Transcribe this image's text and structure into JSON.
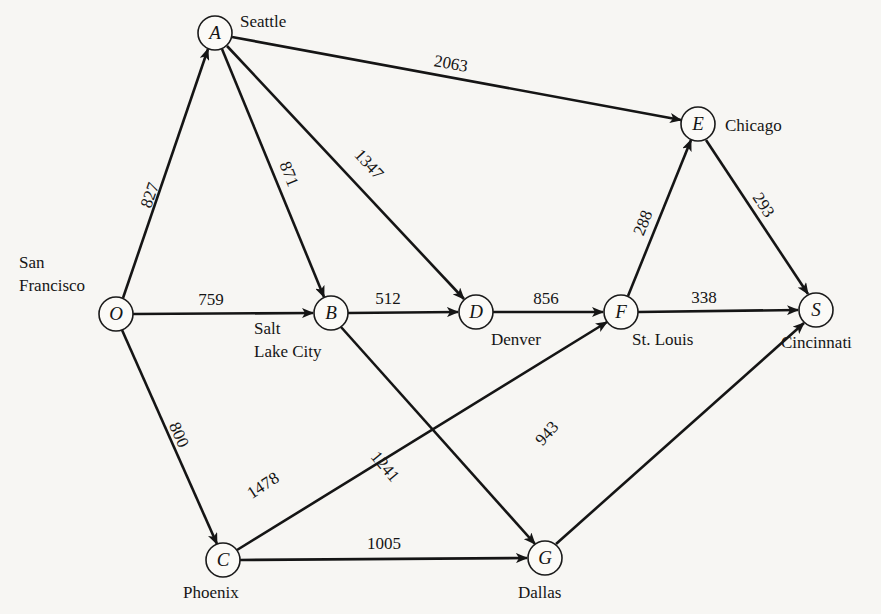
{
  "diagram": {
    "type": "directed-weighted-network",
    "nodes": [
      {
        "id": "O",
        "city": [
          "San",
          "Francisco"
        ],
        "x": 116,
        "y": 314
      },
      {
        "id": "A",
        "city": [
          "Seattle"
        ],
        "x": 215,
        "y": 33
      },
      {
        "id": "B",
        "city": [
          "Salt",
          "Lake City"
        ],
        "x": 331,
        "y": 313
      },
      {
        "id": "C",
        "city": [
          "Phoenix"
        ],
        "x": 223,
        "y": 560
      },
      {
        "id": "D",
        "city": [
          "Denver"
        ],
        "x": 476,
        "y": 312
      },
      {
        "id": "E",
        "city": [
          "Chicago"
        ],
        "x": 698,
        "y": 124
      },
      {
        "id": "F",
        "city": [
          "St. Louis"
        ],
        "x": 621,
        "y": 312
      },
      {
        "id": "G",
        "city": [
          "Dallas"
        ],
        "x": 545,
        "y": 558
      },
      {
        "id": "S",
        "city": [
          "Cincinnati"
        ],
        "x": 816,
        "y": 310
      }
    ],
    "edges": [
      {
        "from": "O",
        "to": "A",
        "weight": "827"
      },
      {
        "from": "O",
        "to": "B",
        "weight": "759"
      },
      {
        "from": "O",
        "to": "C",
        "weight": "800"
      },
      {
        "from": "A",
        "to": "B",
        "weight": "871"
      },
      {
        "from": "A",
        "to": "D",
        "weight": "1347"
      },
      {
        "from": "A",
        "to": "E",
        "weight": "2063"
      },
      {
        "from": "B",
        "to": "D",
        "weight": "512"
      },
      {
        "from": "B",
        "to": "G",
        "weight": "1241"
      },
      {
        "from": "C",
        "to": "F",
        "weight": "1478"
      },
      {
        "from": "C",
        "to": "G",
        "weight": "1005"
      },
      {
        "from": "D",
        "to": "F",
        "weight": "856"
      },
      {
        "from": "F",
        "to": "E",
        "weight": "288"
      },
      {
        "from": "F",
        "to": "S",
        "weight": "338"
      },
      {
        "from": "E",
        "to": "S",
        "weight": "293"
      },
      {
        "from": "G",
        "to": "S",
        "weight": "943"
      }
    ]
  },
  "labels": {
    "O": "O",
    "A": "A",
    "B": "B",
    "C": "C",
    "D": "D",
    "E": "E",
    "F": "F",
    "G": "G",
    "S": "S",
    "city_O_1": "San",
    "city_O_2": "Francisco",
    "city_A": "Seattle",
    "city_B_1": "Salt",
    "city_B_2": "Lake City",
    "city_C": "Phoenix",
    "city_D": "Denver",
    "city_E": "Chicago",
    "city_F": "St. Louis",
    "city_G": "Dallas",
    "city_S": "Cincinnati",
    "w_OA": "827",
    "w_OB": "759",
    "w_OC": "800",
    "w_AB": "871",
    "w_AD": "1347",
    "w_AE": "2063",
    "w_BD": "512",
    "w_BG": "1241",
    "w_CF": "1478",
    "w_CG": "1005",
    "w_DF": "856",
    "w_FE": "288",
    "w_FS": "338",
    "w_ES": "293",
    "w_GS": "943"
  }
}
